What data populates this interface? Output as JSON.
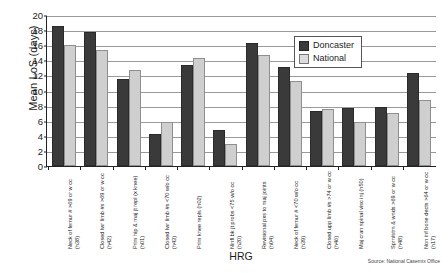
{
  "chart_data": {
    "type": "bar",
    "title": "",
    "xlabel": "HRG",
    "ylabel": "Mean LoS (days)",
    "ylim": [
      0,
      20
    ],
    "ytick_step": 2,
    "yticks": [
      0,
      2,
      4,
      6,
      8,
      10,
      12,
      14,
      16,
      18,
      20
    ],
    "grid": true,
    "legend_position": "top-right",
    "categories": [
      "Neck of femur # >69 or w cc (h38)",
      "Closed lwr limb #s >69 or w cc (h42)",
      "Prim hip & maj jt repl (x knee) (h01)",
      "Closed lwr limb #s <70 w/o cc (h43)",
      "Prim knee repls (h02)",
      "Ninfl bk jt probs <75 w/o cc (h20)",
      "Revisional pxs to maj joints (h04)",
      "Neck of femur # <70 w/o cc (h39)",
      "Closed upp limb #s >74 or w cc (h46)",
      "Maj cran spinal visc inj (h50)",
      "Sprn/strn & wnds >69 or w cc (h48)",
      "Non inf bone dects >64 or w cc (h17)"
    ],
    "series": [
      {
        "name": "Doncaster",
        "color": "#3a3a3a",
        "values": [
          18.3,
          17.5,
          11.2,
          4.0,
          13.1,
          4.5,
          16.0,
          12.9,
          7.0,
          7.4,
          7.6,
          12.1
        ]
      },
      {
        "name": "National",
        "color": "#cfcfcf",
        "values": [
          15.8,
          15.1,
          12.5,
          5.5,
          14.1,
          2.6,
          14.5,
          11.0,
          7.3,
          5.5,
          6.7,
          8.5
        ]
      }
    ],
    "annotations": {
      "source": "Source: National Casemix Office"
    }
  }
}
